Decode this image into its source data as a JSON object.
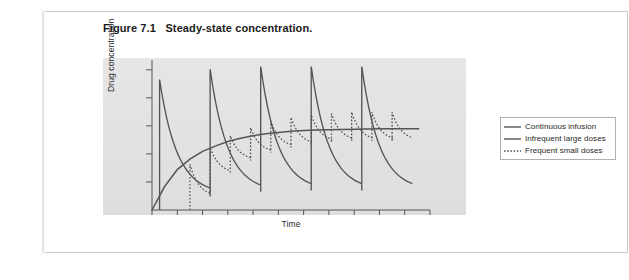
{
  "figure": {
    "title": "Figure 7.1   Steady-state concentration.",
    "title_label": "Figure 7.1",
    "title_caption": "Steady-state concentration."
  },
  "axes": {
    "y_label": "Drug concentration",
    "x_label": "Time",
    "y_tick_count": 5,
    "x_tick_count": 11,
    "axis_color": "#555555",
    "panel_color": "#e3e3e3"
  },
  "legend": {
    "position": "right",
    "items": [
      {
        "label": "Continuous infusion",
        "style": "solid",
        "color": "#555555"
      },
      {
        "label": "Infrequent large doses",
        "style": "solid",
        "color": "#555555"
      },
      {
        "label": "Frequent small doses",
        "style": "dotted",
        "color": "#555555"
      }
    ]
  },
  "chart_data": {
    "type": "line",
    "title": "Steady-state concentration.",
    "xlabel": "Time",
    "ylabel": "Drug concentration",
    "xlim": [
      0,
      11
    ],
    "ylim": [
      0,
      1.15
    ],
    "grid": false,
    "legend_position": "right",
    "axis_ticks_labeled": false,
    "steady_state_level": 0.62,
    "series": [
      {
        "name": "Continuous infusion",
        "style": "solid",
        "description": "Exponential rise to plateau at steady-state level",
        "x": [
          0,
          0.5,
          1,
          1.5,
          2,
          2.5,
          3,
          3.5,
          4,
          4.5,
          5,
          5.5,
          6,
          6.5,
          7,
          7.5,
          8,
          8.5,
          9,
          9.5,
          10
        ],
        "y": [
          0.0,
          0.18,
          0.31,
          0.39,
          0.45,
          0.49,
          0.525,
          0.55,
          0.57,
          0.585,
          0.595,
          0.603,
          0.609,
          0.613,
          0.616,
          0.618,
          0.62,
          0.621,
          0.622,
          0.622,
          0.622
        ]
      },
      {
        "name": "Infrequent large doses",
        "style": "solid",
        "description": "Five large sawtooth peaks with long decay, same mean as infusion",
        "dose_count": 5,
        "dose_interval": 2,
        "peaks": [
          1.0,
          1.08,
          1.1,
          1.1,
          1.1
        ],
        "troughs": [
          0.12,
          0.14,
          0.15,
          0.15,
          0.15
        ],
        "peak_times": [
          0.3,
          2.3,
          4.3,
          6.3,
          8.3
        ]
      },
      {
        "name": "Frequent small doses",
        "style": "dotted",
        "description": "Eleven small sawtooth oscillations around the steady-state level",
        "dose_count": 11,
        "dose_interval": 0.8,
        "peaks": [
          0.35,
          0.48,
          0.57,
          0.63,
          0.68,
          0.71,
          0.73,
          0.74,
          0.75,
          0.75,
          0.75
        ],
        "troughs": [
          0.1,
          0.28,
          0.38,
          0.44,
          0.48,
          0.5,
          0.52,
          0.53,
          0.53,
          0.53,
          0.53
        ],
        "peak_times": [
          1.5,
          2.3,
          3.1,
          3.9,
          4.7,
          5.5,
          6.3,
          7.1,
          7.9,
          8.7,
          9.5
        ]
      }
    ]
  }
}
